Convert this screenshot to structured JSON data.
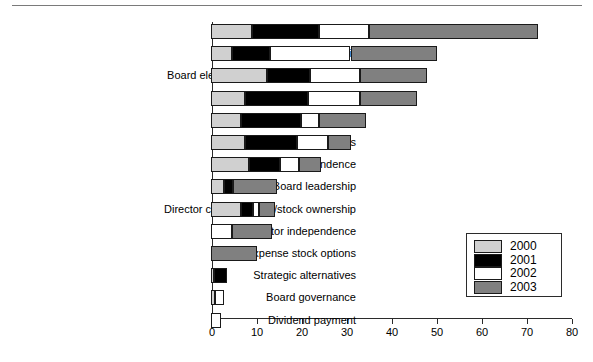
{
  "chart_data": {
    "type": "bar",
    "orientation": "horizontal",
    "stacked": true,
    "title": "",
    "xlabel": "",
    "ylabel": "",
    "xlim": [
      0,
      80
    ],
    "xticks": [
      0,
      10,
      20,
      30,
      40,
      50,
      60,
      70,
      80
    ],
    "xtick_labels": [
      "0",
      "10",
      "20",
      "30",
      "40",
      "50",
      "60",
      "70",
      "80"
    ],
    "grid": false,
    "legend_position": "center-right",
    "colors": {
      "2000": "#d0d0d0",
      "2001": "#000000",
      "2002": "#ffffff",
      "2003": "#808080"
    },
    "legend": [
      {
        "label": "2000",
        "swatch": "c2000"
      },
      {
        "label": "2001",
        "swatch": "c2001"
      },
      {
        "label": "2002",
        "swatch": "c2002"
      },
      {
        "label": "2003",
        "swatch": "c2003"
      }
    ],
    "categories": [
      "Executive compensation",
      "Poison pill",
      "Board elections: terms limits/declassify",
      "Voting",
      "Director nomination",
      "Shareholders' rights",
      "Director/board independence",
      "Board leadership",
      "Director compensation/stock ownership",
      "Auditor independence",
      "Expense stock options",
      "Strategic alternatives",
      "Board governance",
      "Dividend payment"
    ],
    "series": [
      {
        "name": "2000",
        "values": [
          9,
          4.7,
          12.5,
          7.5,
          6.7,
          7.5,
          8.5,
          2.8,
          6.7,
          0,
          0,
          0.7,
          0.8,
          0
        ]
      },
      {
        "name": "2001",
        "values": [
          15,
          8.4,
          9.5,
          14,
          13.4,
          11.5,
          6.8,
          2,
          2.7,
          0,
          0,
          2.8,
          0,
          0
        ]
      },
      {
        "name": "2002",
        "values": [
          11,
          17.9,
          11,
          11.5,
          4,
          7,
          4.2,
          0,
          1.3,
          4.7,
          0,
          0,
          2.2,
          2.2
        ]
      },
      {
        "name": "2003",
        "values": [
          37.6,
          19.3,
          15,
          12.7,
          10.4,
          5,
          5,
          9.8,
          3.5,
          8.9,
          10.3,
          0,
          0,
          0
        ]
      }
    ],
    "totals": [
      72.6,
      50.3,
      48,
      45.7,
      34.5,
      31,
      24.5,
      14.6,
      14.2,
      13.6,
      10.3,
      3.5,
      3,
      2.2
    ]
  }
}
